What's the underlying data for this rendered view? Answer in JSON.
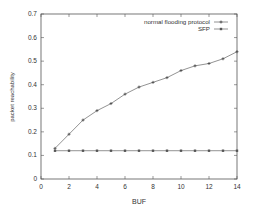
{
  "chart_data": {
    "type": "line",
    "title": "",
    "xlabel": "BUF",
    "ylabel": "packet reachability",
    "xlim": [
      0,
      14
    ],
    "ylim": [
      0,
      0.7
    ],
    "xticks": [
      "0",
      "2",
      "4",
      "6",
      "8",
      "10",
      "12",
      "14"
    ],
    "yticks": [
      "0",
      "0.1",
      "0.2",
      "0.3",
      "0.4",
      "0.5",
      "0.6",
      "0.7"
    ],
    "grid": false,
    "legend_position": "top-right",
    "x": [
      1,
      2,
      3,
      4,
      5,
      6,
      7,
      8,
      9,
      10,
      11,
      12,
      13,
      14
    ],
    "series": [
      {
        "name": "normal flooding protocol",
        "values": [
          0.13,
          0.19,
          0.25,
          0.29,
          0.32,
          0.36,
          0.39,
          0.41,
          0.43,
          0.46,
          0.48,
          0.49,
          0.51,
          0.54
        ]
      },
      {
        "name": "SFP",
        "values": [
          0.12,
          0.12,
          0.12,
          0.12,
          0.12,
          0.12,
          0.12,
          0.12,
          0.12,
          0.12,
          0.12,
          0.12,
          0.12,
          0.12
        ]
      }
    ]
  }
}
